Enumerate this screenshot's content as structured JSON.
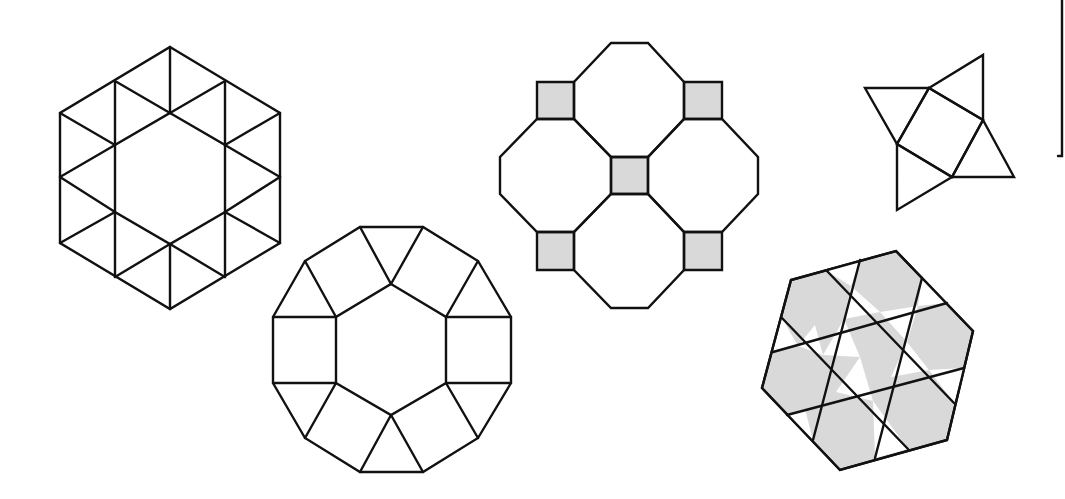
{
  "diagram": {
    "title": "",
    "colors": {
      "stroke": "#111111",
      "tile_gray": "#d9d9d9",
      "background": "#ffffff"
    },
    "figures": [
      {
        "id": "hexagon-triangles",
        "description": "Hexagon subdivided into 12 triangles around a central hexagon (3.6.3.6 style)",
        "polygons": [
          {
            "fill": "none",
            "points": "170,47 280,113 280,243 170,309 60,243 60,113"
          },
          {
            "fill": "none",
            "points": "170,113 225,145 225,212 170,244 115,212 115,145"
          }
        ],
        "lines": [
          [
            170,
            47,
            170,
            113
          ],
          [
            115,
            81,
            115,
            145
          ],
          [
            225,
            81,
            225,
            145
          ],
          [
            115,
            81,
            170,
            113
          ],
          [
            225,
            81,
            170,
            113
          ],
          [
            60,
            113,
            115,
            145
          ],
          [
            280,
            113,
            225,
            145
          ],
          [
            60,
            177,
            115,
            145
          ],
          [
            280,
            177,
            225,
            145
          ],
          [
            60,
            177,
            115,
            212
          ],
          [
            280,
            177,
            225,
            212
          ],
          [
            60,
            243,
            115,
            212
          ],
          [
            280,
            243,
            225,
            212
          ],
          [
            115,
            212,
            115,
            277
          ],
          [
            225,
            212,
            225,
            277
          ],
          [
            115,
            277,
            170,
            244
          ],
          [
            225,
            277,
            170,
            244
          ],
          [
            170,
            244,
            170,
            309
          ]
        ]
      },
      {
        "id": "dodecagon-squares-triangles",
        "description": "Dodecagon with inner hexagon, surrounded by squares and triangles",
        "polygons": [
          {
            "fill": "none",
            "points": "360,227 423,227 478,261 511,317 511,383 478,438 423,472 360,472 305,438 273,383 273,317 305,261"
          },
          {
            "fill": "none",
            "points": "391,284 446,317 446,383 391,415 336,383 336,317"
          }
        ],
        "lines": [
          [
            360,
            227,
            391,
            284
          ],
          [
            423,
            227,
            391,
            284
          ],
          [
            305,
            261,
            336,
            317
          ],
          [
            478,
            261,
            446,
            317
          ],
          [
            273,
            317,
            336,
            317
          ],
          [
            446,
            317,
            511,
            317
          ],
          [
            273,
            383,
            336,
            383
          ],
          [
            446,
            383,
            511,
            383
          ],
          [
            305,
            438,
            336,
            383
          ],
          [
            478,
            438,
            446,
            383
          ],
          [
            360,
            472,
            391,
            415
          ],
          [
            423,
            472,
            391,
            415
          ]
        ]
      },
      {
        "id": "octagons-squares",
        "description": "Four octagons with five gray squares (4.8.8 tiling)",
        "polygons": [
          {
            "fill": "gray",
            "points": "537,82 574,82 574,119 537,119"
          },
          {
            "fill": "gray",
            "points": "684,82 722,82 722,119 684,119"
          },
          {
            "fill": "gray",
            "points": "611,157 648,157 648,194 611,194"
          },
          {
            "fill": "gray",
            "points": "537,232 574,232 574,270 537,270"
          },
          {
            "fill": "gray",
            "points": "684,232 722,232 722,270 684,270"
          },
          {
            "fill": "none",
            "points": "611,43 648,43 684,82 684,119 648,157 611,157 574,119 574,82"
          },
          {
            "fill": "none",
            "points": "537,119 574,119 611,157 611,194 574,232 537,232 500,194 500,157"
          },
          {
            "fill": "none",
            "points": "684,119 722,119 758,157 758,194 722,232 684,232 648,194 648,157"
          },
          {
            "fill": "none",
            "points": "611,194 648,194 684,232 684,270 648,308 611,308 574,270 574,232"
          }
        ],
        "lines": []
      },
      {
        "id": "square-four-triangles",
        "description": "Tilted square with four equilateral triangles attached",
        "polygons": [
          {
            "fill": "none",
            "points": "929,88 983,120 952,177 897,144"
          },
          {
            "fill": "none",
            "points": "929,88 983,55 983,120"
          },
          {
            "fill": "none",
            "points": "929,88 865,88 897,144"
          },
          {
            "fill": "none",
            "points": "983,120 1014,177 952,177"
          },
          {
            "fill": "none",
            "points": "952,177 897,210 897,144"
          }
        ],
        "lines": []
      },
      {
        "id": "gray-hexagon-trihexagonal",
        "description": "Tilted hexagon with three families of parallel lines forming gray hexagons and white triangles",
        "polygons": [
          {
            "fill": "gray",
            "points": "896,251 973,331 947,440 840,470 762,388 791,280"
          }
        ],
        "white_triangles": [
          "827,271 860,260 851,286",
          "782,318 773,352 798,346",
          "922,278 947,303 918,306",
          "851,286 880,312 844,319",
          "815,325 798,346 823,355",
          "880,312 918,306 907,342",
          "823,355 844,319 860,357",
          "860,357 873,401 836,392",
          "907,342 929,370 891,377",
          "787,415 813,440 805,409",
          "873,401 908,449 875,458",
          "929,370 964,368 954,403"
        ],
        "lines": [
          [
            773,
            352,
            947,
            303
          ],
          [
            787,
            415,
            964,
            368
          ],
          [
            860,
            260,
            813,
            440
          ],
          [
            922,
            278,
            875,
            458
          ],
          [
            827,
            271,
            954,
            403
          ],
          [
            782,
            318,
            908,
            449
          ]
        ]
      }
    ],
    "frame_line": {
      "points": "1062,0 1062,156 1058,156"
    }
  }
}
